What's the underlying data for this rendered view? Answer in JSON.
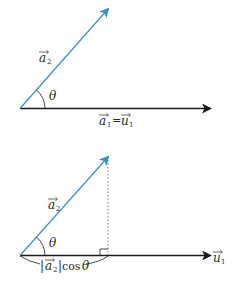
{
  "colors": {
    "vector_a2": "#3a8fc4",
    "vector_a1": "#1a1a1a",
    "text": "#2a2a2a",
    "projection_line": "#555555"
  },
  "figure_top": {
    "vector_a2_label": {
      "base": "a",
      "sub": "2"
    },
    "angle_label": "θ",
    "vector_a1_label": {
      "base": "a",
      "sub": "1",
      "eq": "=",
      "base2": "u",
      "sub2": "1"
    }
  },
  "figure_bottom": {
    "vector_a2_label": {
      "base": "a",
      "sub": "2"
    },
    "angle_label": "θ",
    "projection_label": {
      "abs_open": "|",
      "base": "a",
      "sub": "2",
      "abs_close": "|",
      "func": "cos",
      "angle": "θ"
    },
    "u1_label": {
      "base": "u",
      "sub": "1"
    }
  }
}
